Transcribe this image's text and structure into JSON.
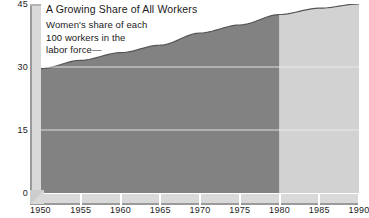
{
  "chart_data": {
    "type": "area",
    "title": "A Growing Share of All Workers",
    "annotation_lines": [
      "Women's share of each",
      "100 workers in the",
      "labor force—"
    ],
    "xlabel": "",
    "ylabel": "",
    "xlim": [
      1950,
      1990
    ],
    "ylim": [
      0,
      45
    ],
    "yticks": [
      0,
      15,
      30,
      45
    ],
    "ytick_labels": [
      "0",
      "15",
      "30",
      "45"
    ],
    "xticks": [
      1950,
      1955,
      1960,
      1965,
      1970,
      1975,
      1980,
      1985,
      1990
    ],
    "xtick_labels": [
      "1950",
      "1955",
      "1960",
      "1965",
      "1970",
      "1975",
      "1980",
      "1985",
      "1990"
    ],
    "grid": true,
    "gridlines": [
      15,
      30
    ],
    "legend": "none",
    "series": [
      {
        "name": "Women's share of all workers",
        "x": [
          1950,
          1955,
          1960,
          1965,
          1970,
          1975,
          1980,
          1985,
          1990
        ],
        "values": [
          29.6,
          31.6,
          33.4,
          35.2,
          38.1,
          40.0,
          42.5,
          44.0,
          45.0
        ],
        "actual_through": 1980,
        "projected_from": 1980
      }
    ],
    "segments": [
      {
        "name": "actual",
        "range": [
          1950,
          1980
        ],
        "color": "#828282"
      },
      {
        "name": "projected",
        "range": [
          1980,
          1990
        ],
        "color": "#d2d2d2"
      }
    ],
    "colors": {
      "actual_fill": "#828282",
      "projected_fill": "#d2d2d2",
      "curve_line": "#555555",
      "axis_bar": "#d9d9d9",
      "axis_edge": "#9a9a9a",
      "gridline": "#f0f0f0",
      "text": "#1a1a1a",
      "background": "#ffffff"
    }
  }
}
